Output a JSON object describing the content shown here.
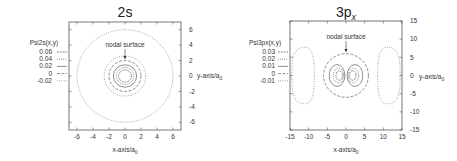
{
  "chart_data": [
    {
      "type": "contour",
      "title": "2s",
      "title_sub": "",
      "xlabel": "x-axis/a",
      "xlabel_sub": "0",
      "ylabel": "y-axis/a",
      "ylabel_sub": "0",
      "xlim": [
        -7,
        7
      ],
      "ylim": [
        -7,
        7
      ],
      "xticks": [
        -6,
        -4,
        -2,
        0,
        2,
        4,
        6
      ],
      "yticks": [
        6,
        4,
        2,
        0,
        -2,
        -4,
        -6
      ],
      "legend_title": "Psi2s(x,y)",
      "legend_position": "left",
      "legend": [
        {
          "label": "0.06",
          "dash": "2,0.8"
        },
        {
          "label": "0.04",
          "dash": "1,1"
        },
        {
          "label": "0.02",
          "dash": ""
        },
        {
          "label": "0",
          "dash": "3,1.5"
        },
        {
          "label": "-0.02",
          "dash": "0.8,1.5"
        }
      ],
      "annotation": "nodal surface",
      "annotation_target": [
        0,
        2
      ],
      "contours": [
        {
          "level": 0.06,
          "radius": 0.8
        },
        {
          "level": 0.04,
          "radius": 1.1
        },
        {
          "level": 0.02,
          "radius": 1.45
        },
        {
          "level": 0,
          "radius": 2.0
        },
        {
          "level": -0.02,
          "radius": 2.6
        },
        {
          "level": -0.02,
          "radius": 6.0
        }
      ]
    },
    {
      "type": "contour",
      "title": "3p",
      "title_sub": "x",
      "xlabel": "x-axis/a",
      "xlabel_sub": "0",
      "ylabel": "y-axis/a",
      "ylabel_sub": "0",
      "xlim": [
        -15,
        15
      ],
      "ylim": [
        -15,
        15
      ],
      "xticks": [
        -15,
        -10,
        -5,
        0,
        5,
        10,
        15
      ],
      "yticks": [
        15,
        10,
        5,
        0,
        -5,
        -10,
        -15
      ],
      "legend_title": "Psi3px(x,y)",
      "legend_position": "left",
      "legend": [
        {
          "label": "0.03",
          "dash": "2,0.8"
        },
        {
          "label": "0.02",
          "dash": "1,1"
        },
        {
          "label": "0.01",
          "dash": ""
        },
        {
          "label": "0",
          "dash": "3,1.5"
        },
        {
          "label": "-0.01",
          "dash": "0.8,1.5"
        }
      ],
      "annotation": "nodal surface",
      "annotation_target": [
        0,
        6
      ],
      "contours": [
        {
          "level": 0,
          "shape": "circle",
          "radius": 6
        },
        {
          "level": 0.03,
          "shape": "lobe-pair",
          "rx": 0.9,
          "ry": 1.3,
          "cx": 1.8
        },
        {
          "level": 0.02,
          "shape": "lobe-pair",
          "rx": 1.4,
          "ry": 2.0,
          "cx": 2.0
        },
        {
          "level": 0.01,
          "shape": "lobe-pair",
          "rx": 2.1,
          "ry": 3.0,
          "cx": 2.4
        },
        {
          "level": -0.01,
          "shape": "outer-lobe-pair",
          "inner_x": 8.5,
          "outer_x": 14.5,
          "half_height": 7.8
        }
      ]
    }
  ]
}
